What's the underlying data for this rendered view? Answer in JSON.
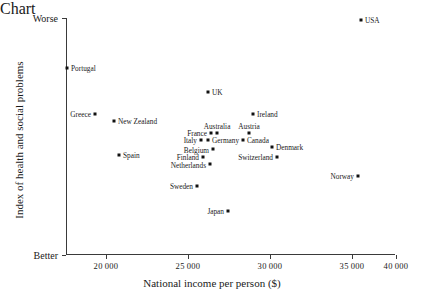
{
  "chart_data": {
    "type": "scatter",
    "title": "",
    "xlabel": "National income per person ($)",
    "ylabel": "Index of health and social problems",
    "xlim": [
      18000,
      40300
    ],
    "ylim": [
      0,
      1
    ],
    "grid": false,
    "legend": null,
    "x_ticks": [
      {
        "value": 20000,
        "label": "20 000",
        "px": 106
      },
      {
        "value": 25000,
        "label": "25 000",
        "px": 188
      },
      {
        "value": 30000,
        "label": "30 000",
        "px": 270
      },
      {
        "value": 35000,
        "label": "35 000",
        "px": 352
      },
      {
        "value": 40000,
        "label": "40 000",
        "px": 396
      }
    ],
    "y_ticks": [
      {
        "label": "Worse",
        "position": "top",
        "px": 18
      },
      {
        "label": "Better",
        "position": "bottom",
        "px": 255
      }
    ],
    "points": [
      {
        "name": "USA",
        "income": 37100,
        "index_rank": 1,
        "px": 361,
        "py": 20,
        "label_side": "right"
      },
      {
        "name": "Portugal",
        "income": 17800,
        "index_rank": 2,
        "px": 67,
        "py": 68,
        "label_side": "right"
      },
      {
        "name": "UK",
        "income": 28200,
        "index_rank": 3,
        "px": 208,
        "py": 92,
        "label_side": "right"
      },
      {
        "name": "Greece",
        "income": 19400,
        "index_rank": 4,
        "px": 95,
        "py": 114,
        "label_side": "left"
      },
      {
        "name": "Ireland",
        "income": 30900,
        "index_rank": 5,
        "px": 253,
        "py": 114,
        "label_side": "right"
      },
      {
        "name": "New Zealand",
        "income": 20500,
        "index_rank": 6,
        "px": 114,
        "py": 121,
        "label_side": "right"
      },
      {
        "name": "Australia",
        "income": 26800,
        "index_rank": 7,
        "px": 217,
        "py": 133,
        "label_side": "above"
      },
      {
        "name": "France",
        "income": 26400,
        "index_rank": 8,
        "px": 211,
        "py": 133,
        "label_side": "left"
      },
      {
        "name": "Austria",
        "income": 30400,
        "index_rank": 9,
        "px": 249,
        "py": 133,
        "label_side": "above"
      },
      {
        "name": "Italy",
        "income": 25800,
        "index_rank": 10,
        "px": 201,
        "py": 140,
        "label_side": "left"
      },
      {
        "name": "Germany",
        "income": 26200,
        "index_rank": 11,
        "px": 208,
        "py": 140,
        "label_side": "right"
      },
      {
        "name": "Canada",
        "income": 30300,
        "index_rank": 12,
        "px": 243,
        "py": 140,
        "label_side": "right"
      },
      {
        "name": "Denmark",
        "income": 32100,
        "index_rank": 13,
        "px": 272,
        "py": 147,
        "label_side": "right"
      },
      {
        "name": "Belgium",
        "income": 26900,
        "index_rank": 14,
        "px": 213,
        "py": 149,
        "label_side": "below-left"
      },
      {
        "name": "Spain",
        "income": 20800,
        "index_rank": 15,
        "px": 119,
        "py": 155,
        "label_side": "right"
      },
      {
        "name": "Finland",
        "income": 25900,
        "index_rank": 16,
        "px": 203,
        "py": 157,
        "label_side": "left"
      },
      {
        "name": "Switzerland",
        "income": 32400,
        "index_rank": 17,
        "px": 277,
        "py": 157,
        "label_side": "left"
      },
      {
        "name": "Netherlands",
        "income": 26400,
        "index_rank": 18,
        "px": 210,
        "py": 164,
        "label_side": "below-left"
      },
      {
        "name": "Norway",
        "income": 35400,
        "index_rank": 19,
        "px": 358,
        "py": 176,
        "label_side": "left"
      },
      {
        "name": "Sweden",
        "income": 25500,
        "index_rank": 20,
        "px": 197,
        "py": 186,
        "label_side": "left"
      },
      {
        "name": "Japan",
        "income": 27400,
        "index_rank": 21,
        "px": 228,
        "py": 211,
        "label_side": "left"
      }
    ]
  }
}
